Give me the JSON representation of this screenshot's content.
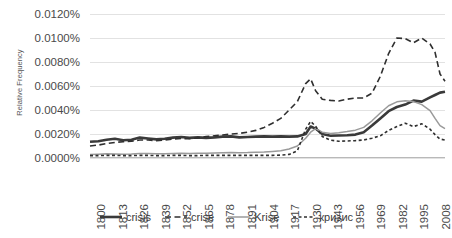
{
  "chart_data": {
    "type": "line",
    "title": "",
    "xlabel": "",
    "ylabel": "Relative Frequency",
    "ylim": [
      0,
      0.012
    ],
    "xlim": [
      1800,
      2014
    ],
    "grid": true,
    "legend_position": "bottom",
    "y_tick_labels": [
      "0.0120%",
      "0.0100%",
      "0.0080%",
      "0.0060%",
      "0.0040%",
      "0.0020%",
      "0.0000%"
    ],
    "y_tick_values": [
      0.012,
      0.01,
      0.008,
      0.006,
      0.004,
      0.002,
      0.0
    ],
    "x_tick_labels": [
      "1800",
      "1813",
      "1826",
      "1839",
      "1852",
      "1865",
      "1878",
      "1891",
      "1904",
      "1917",
      "1930",
      "1943",
      "1956",
      "1969",
      "1982",
      "1995",
      "2008"
    ],
    "x_tick_values": [
      1800,
      1813,
      1826,
      1839,
      1852,
      1865,
      1878,
      1891,
      1904,
      1917,
      1930,
      1943,
      1956,
      1969,
      1982,
      1995,
      2008
    ],
    "x": [
      1800,
      1805,
      1810,
      1815,
      1820,
      1825,
      1830,
      1835,
      1840,
      1845,
      1850,
      1855,
      1860,
      1865,
      1870,
      1875,
      1880,
      1885,
      1890,
      1895,
      1900,
      1905,
      1910,
      1915,
      1920,
      1925,
      1930,
      1933,
      1936,
      1940,
      1945,
      1950,
      1955,
      1960,
      1965,
      1970,
      1975,
      1980,
      1985,
      1990,
      1995,
      2000,
      2005,
      2008,
      2011,
      2014
    ],
    "series": [
      {
        "name": "crisis",
        "style": "solid-thick-dark",
        "color": "#3a3a3a",
        "values": [
          0.00135,
          0.0014,
          0.00152,
          0.0016,
          0.00148,
          0.00152,
          0.0017,
          0.00162,
          0.00155,
          0.0016,
          0.0017,
          0.00175,
          0.00168,
          0.00172,
          0.00168,
          0.00172,
          0.00178,
          0.0018,
          0.00172,
          0.00175,
          0.00178,
          0.0018,
          0.00178,
          0.0018,
          0.00178,
          0.0018,
          0.002,
          0.00262,
          0.00245,
          0.002,
          0.00185,
          0.00188,
          0.0019,
          0.00195,
          0.00215,
          0.0027,
          0.0033,
          0.0039,
          0.00425,
          0.00445,
          0.00478,
          0.0047,
          0.00505,
          0.00525,
          0.00545,
          0.00552
        ]
      },
      {
        "name": "crise",
        "style": "dashed-long-dark",
        "color": "#2f2f2f",
        "values": [
          0.001,
          0.00108,
          0.0012,
          0.0013,
          0.00135,
          0.0014,
          0.0015,
          0.0015,
          0.00145,
          0.0015,
          0.00158,
          0.00162,
          0.0016,
          0.00168,
          0.00178,
          0.00185,
          0.00192,
          0.002,
          0.00205,
          0.00215,
          0.0023,
          0.00255,
          0.0029,
          0.0033,
          0.004,
          0.0047,
          0.0062,
          0.0066,
          0.0056,
          0.0049,
          0.0048,
          0.00475,
          0.0049,
          0.005,
          0.005,
          0.0054,
          0.0068,
          0.0087,
          0.01,
          0.00995,
          0.0096,
          0.01,
          0.0095,
          0.0088,
          0.007,
          0.0064
        ]
      },
      {
        "name": "Krise",
        "style": "solid-thin-gray",
        "color": "#9a9a9a",
        "values": [
          0.0003,
          0.00032,
          0.00035,
          0.00034,
          0.00032,
          0.00034,
          0.00038,
          0.00038,
          0.00036,
          0.00036,
          0.00038,
          0.0004,
          0.00038,
          0.0004,
          0.0004,
          0.00042,
          0.00044,
          0.00045,
          0.00044,
          0.00045,
          0.00048,
          0.0005,
          0.00055,
          0.0006,
          0.00075,
          0.001,
          0.00165,
          0.00215,
          0.00245,
          0.00215,
          0.00205,
          0.0021,
          0.0022,
          0.00232,
          0.00255,
          0.0031,
          0.00375,
          0.00435,
          0.00468,
          0.00478,
          0.0047,
          0.00445,
          0.00395,
          0.0033,
          0.0027,
          0.00245
        ]
      },
      {
        "name": "кризис",
        "style": "dashed-short-dark",
        "color": "#2f2f2f",
        "values": [
          0.0002,
          0.0002,
          0.00022,
          0.00022,
          0.0002,
          0.0002,
          0.00022,
          0.00022,
          0.0002,
          0.0002,
          0.00022,
          0.00022,
          0.0002,
          0.0002,
          0.00022,
          0.00022,
          0.00022,
          0.00022,
          0.00022,
          0.00022,
          0.00022,
          0.00022,
          0.00022,
          0.00024,
          0.0003,
          0.0006,
          0.0024,
          0.00305,
          0.00265,
          0.0018,
          0.00148,
          0.0014,
          0.00142,
          0.00145,
          0.0015,
          0.00165,
          0.00185,
          0.0023,
          0.00262,
          0.0029,
          0.00262,
          0.00285,
          0.0024,
          0.00195,
          0.00158,
          0.0015
        ]
      }
    ],
    "legend": [
      {
        "label": "crisis",
        "style": "solid-thick-dark",
        "color": "#3a3a3a"
      },
      {
        "label": "crise",
        "style": "dashed-long-dark",
        "color": "#2f2f2f"
      },
      {
        "label": "Krise",
        "style": "solid-thin-gray",
        "color": "#9a9a9a"
      },
      {
        "label": "кризис",
        "style": "dashed-short-dark",
        "color": "#2f2f2f"
      }
    ]
  }
}
